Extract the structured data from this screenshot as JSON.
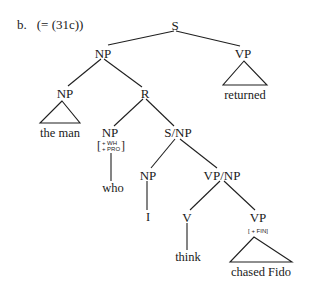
{
  "example": {
    "number": "b.",
    "reference": "(= (31c))"
  },
  "tree": {
    "root": {
      "label": "S",
      "x": 175,
      "y": 25
    },
    "nodes": {
      "np_top": {
        "label": "NP",
        "x": 103,
        "y": 53
      },
      "vp_right": {
        "label": "VP",
        "x": 243,
        "y": 53
      },
      "np_left": {
        "label": "NP",
        "x": 65,
        "y": 93
      },
      "r": {
        "label": "R",
        "x": 145,
        "y": 93
      },
      "np_who": {
        "label": "NP",
        "x": 110,
        "y": 132
      },
      "s_np": {
        "label": "S/NP",
        "x": 178,
        "y": 132
      },
      "np_i": {
        "label": "NP",
        "x": 148,
        "y": 175
      },
      "vp_np": {
        "label": "VP/NP",
        "x": 222,
        "y": 175
      },
      "v": {
        "label": "V",
        "x": 187,
        "y": 217
      },
      "vp_fin": {
        "label": "VP",
        "x": 258,
        "y": 217
      }
    },
    "features": {
      "np_who": {
        "lines": [
          "+ WH",
          "+ PRO"
        ],
        "x": 111,
        "y": 146
      },
      "vp_fin": {
        "text": "[ + FIN]",
        "x": 258,
        "y": 232
      }
    },
    "leaves": {
      "returned": {
        "text": "returned",
        "x": 245,
        "y": 95
      },
      "the_man": {
        "text": "the man",
        "x": 60,
        "y": 133
      },
      "who": {
        "text": "who",
        "x": 113,
        "y": 188
      },
      "i": {
        "text": "I",
        "x": 148,
        "y": 217
      },
      "think": {
        "text": "think",
        "x": 188,
        "y": 257
      },
      "chased_fido": {
        "text": "chased Fido",
        "x": 261,
        "y": 272
      }
    }
  }
}
